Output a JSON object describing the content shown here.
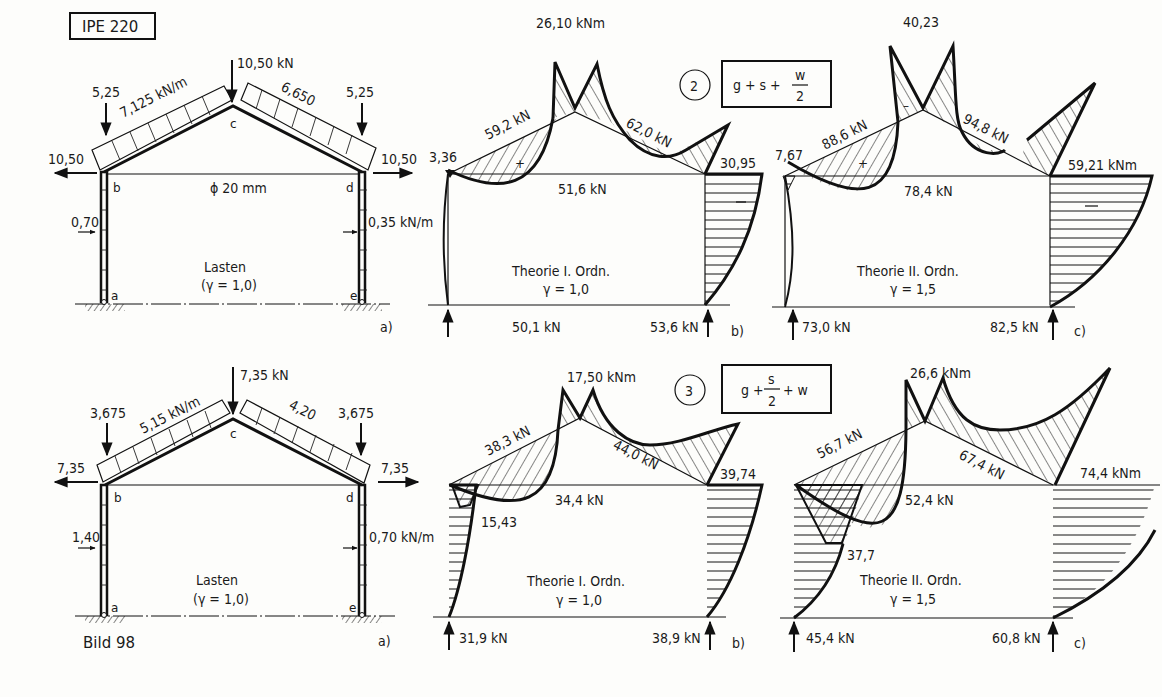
{
  "figure": {
    "caption": "Bild 98",
    "section_label": "IPE 220",
    "tie_label": "ϕ 20 mm"
  },
  "rows": [
    {
      "load_case": {
        "number": "2",
        "formula_prefix": "g + s +",
        "formula_frac_num": "w",
        "formula_frac_den": "2",
        "formula_suffix": ""
      },
      "loads": {
        "eave_left_point": "5,25",
        "eave_right_point": "5,25",
        "ridge_point": "10,50 kN",
        "rafter_left_udl": "7,125 kN/m",
        "rafter_right_udl": "6,650",
        "horiz_left": "10,50",
        "horiz_right": "10,50",
        "wind_left": "0,70",
        "wind_right": "0,35 kN/m",
        "title": "Lasten",
        "gamma": "(γ = 1,0)",
        "nodes": [
          "a",
          "b",
          "c",
          "d",
          "e"
        ],
        "panel_tag": "a)"
      },
      "first_order": {
        "ridge_moment": "26,10 kNm",
        "left_rafter_axial": "59,2 kN",
        "right_rafter_axial": "62,0 kN",
        "tie_force": "51,6 kN",
        "left_eave_moment": "3,36",
        "right_eave_moment": "30,95",
        "reaction_left": "50,1 kN",
        "reaction_right": "53,6 kN",
        "title": "Theorie I. Ordn.",
        "gamma": "γ = 1,0",
        "sign_plus": "+",
        "sign_minus": "–",
        "panel_tag": "b)"
      },
      "second_order": {
        "ridge_moment": "40,23",
        "left_rafter_axial": "88,6 kN",
        "right_rafter_axial": "94,8 kN",
        "tie_force": "78,4 kN",
        "left_eave_moment": "7,67",
        "right_eave_moment": "59,21 kNm",
        "reaction_left": "73,0 kN",
        "reaction_right": "82,5 kN",
        "title": "Theorie II. Ordn.",
        "gamma": "γ = 1,5",
        "sign_plus": "+",
        "sign_minus": "–",
        "panel_tag": "c)"
      }
    },
    {
      "load_case": {
        "number": "3",
        "formula_prefix": "g +",
        "formula_frac_num": "s",
        "formula_frac_den": "2",
        "formula_suffix": "+ w"
      },
      "loads": {
        "eave_left_point": "3,675",
        "eave_right_point": "3,675",
        "ridge_point": "7,35 kN",
        "rafter_left_udl": "5,15 kN/m",
        "rafter_right_udl": "4,20",
        "horiz_left": "7,35",
        "horiz_right": "7,35",
        "wind_left": "1,40",
        "wind_right": "0,70 kN/m",
        "title": "Lasten",
        "gamma": "(γ = 1,0)",
        "nodes": [
          "a",
          "b",
          "c",
          "d",
          "e"
        ],
        "panel_tag": "a)"
      },
      "first_order": {
        "ridge_moment": "17,50 kNm",
        "left_rafter_axial": "38,3 kN",
        "right_rafter_axial": "44,0 kN",
        "tie_force": "34,4 kN",
        "left_column_moment": "15,43",
        "right_eave_moment": "39,74",
        "reaction_left": "31,9 kN",
        "reaction_right": "38,9 kN",
        "title": "Theorie I. Ordn.",
        "gamma": "γ = 1,0",
        "panel_tag": "b)"
      },
      "second_order": {
        "ridge_moment": "26,6 kNm",
        "left_rafter_axial": "56,7 kN",
        "right_rafter_axial": "67,4 kN",
        "tie_force": "52,4 kN",
        "left_column_moment": "37,7",
        "right_eave_moment": "74,4 kNm",
        "reaction_left": "45,4 kN",
        "reaction_right": "60,8 kN",
        "title": "Theorie II. Ordn.",
        "gamma": "γ = 1,5",
        "panel_tag": "c)"
      }
    }
  ]
}
